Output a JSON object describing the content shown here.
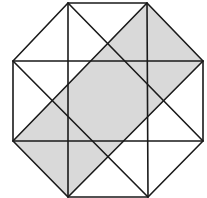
{
  "figure": {
    "title": "",
    "colors": {
      "background": "#ffffff",
      "stroke": "#1a1a1a",
      "shade": "#d9d9d9"
    },
    "stroke_width": 1.6,
    "vertices": {
      "A": [
        68,
        3
      ],
      "B": [
        147,
        3
      ],
      "C": [
        203,
        61
      ],
      "D": [
        203,
        141
      ],
      "E": [
        148,
        197
      ],
      "F": [
        68,
        197
      ],
      "G": [
        13,
        141
      ],
      "H": [
        13,
        61
      ]
    },
    "shaded_polygon": "147,3 203,61 68,197 13,141",
    "octagon_points": "68,3 147,3 203,61 203,141 148,197 68,197 13,141 13,61",
    "lines": [
      {
        "id": "vertical-left",
        "x1": 68,
        "y1": 3,
        "x2": 68,
        "y2": 197
      },
      {
        "id": "vertical-right",
        "x1": 147,
        "y1": 3,
        "x2": 148,
        "y2": 197
      },
      {
        "id": "horizontal-top",
        "x1": 13,
        "y1": 61,
        "x2": 203,
        "y2": 61
      },
      {
        "id": "horizontal-bottom",
        "x1": 13,
        "y1": 141,
        "x2": 203,
        "y2": 141
      },
      {
        "id": "diagonal-A-D",
        "x1": 68,
        "y1": 3,
        "x2": 203,
        "y2": 141
      },
      {
        "id": "diagonal-B-G",
        "x1": 147,
        "y1": 3,
        "x2": 13,
        "y2": 141
      },
      {
        "id": "diagonal-H-E",
        "x1": 13,
        "y1": 61,
        "x2": 148,
        "y2": 197
      },
      {
        "id": "diagonal-C-F",
        "x1": 203,
        "y1": 61,
        "x2": 68,
        "y2": 197
      }
    ]
  }
}
